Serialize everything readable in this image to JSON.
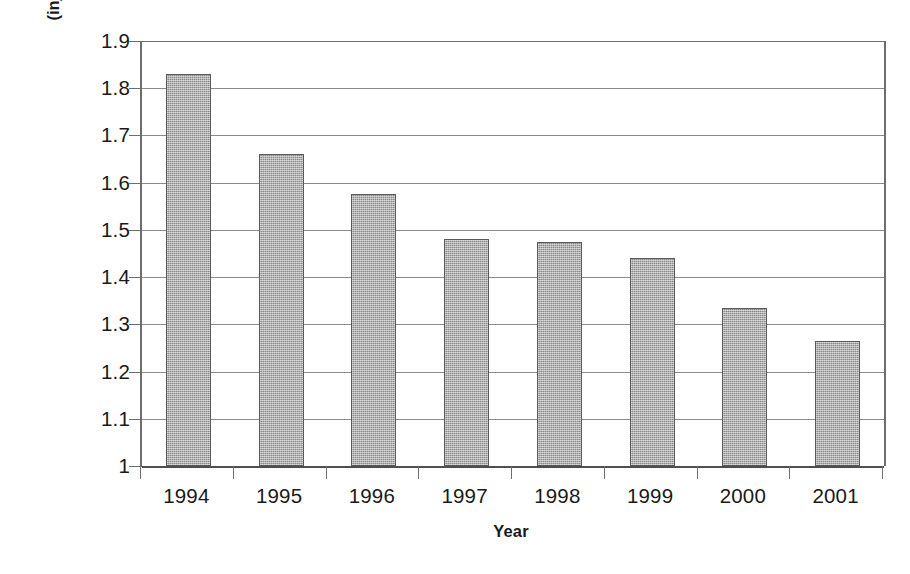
{
  "chart_data": {
    "type": "bar",
    "title": "",
    "xlabel": "Year",
    "ylabel_line1": "MSI Incidence Rate",
    "ylabel_line2": "(injuries/FTE* employees/year)",
    "ylabel": "MSI Incidence Rate (injuries/FTE* employees/year)",
    "categories": [
      "1994",
      "1995",
      "1996",
      "1997",
      "1998",
      "1999",
      "2000",
      "2001"
    ],
    "values": [
      1.83,
      1.66,
      1.575,
      1.48,
      1.475,
      1.44,
      1.335,
      1.265
    ],
    "ylim": [
      1,
      1.9
    ],
    "ytick_labels": [
      "1.9",
      "1.8",
      "1.7",
      "1.6",
      "1.5",
      "1.4",
      "1.3",
      "1.2",
      "1.1",
      "1"
    ],
    "ytick_values": [
      1.9,
      1.8,
      1.7,
      1.6,
      1.5,
      1.4,
      1.3,
      1.2,
      1.1,
      1.0
    ],
    "grid": true,
    "legend": null,
    "legend_position": "none",
    "bar_color": "#a9a9a9",
    "bar_border_color": "#595959",
    "gridline_color": "#8a8a8a",
    "axis_color": "#6e6e6e",
    "text_color": "#1a1a1a",
    "footnote_marker": "*"
  }
}
